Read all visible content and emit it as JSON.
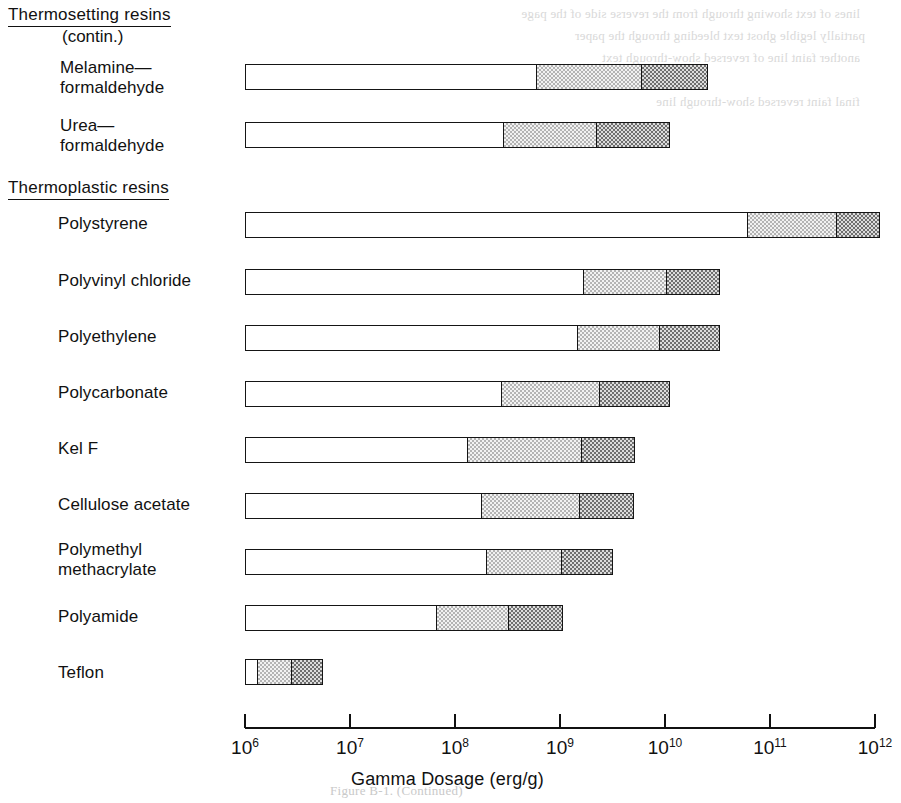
{
  "figure": {
    "caption": "Figure B-1.  (Continued)",
    "bleed_lines": [
      "lines of text showing through from the reverse side of the page",
      "partially legible ghost text bleeding through the paper",
      "another faint line of reversed show-through text",
      "a short faint reversed fragment",
      "final faint reversed show-through line"
    ]
  },
  "groups": [
    {
      "heading": "Thermosetting resins",
      "subheading": "(contin.)"
    },
    {
      "heading": "Thermoplastic resins",
      "subheading": ""
    }
  ],
  "axis": {
    "title": "Gamma Dosage (erg/g)",
    "scale": "log10",
    "min_exponent": 6,
    "max_exponent": 12,
    "tick_labels": [
      "10⁶",
      "10⁷",
      "10⁸",
      "10⁹",
      "10¹⁰",
      "10¹¹",
      "10¹²"
    ],
    "tick_mantissas": [
      "10",
      "10",
      "10",
      "10",
      "10",
      "10",
      "10"
    ],
    "tick_exponents": [
      "6",
      "7",
      "8",
      "9",
      "10",
      "11",
      "12"
    ]
  },
  "legend": {
    "segment_names": [
      "incipient-to-mild damage",
      "moderate damage",
      "severe damage"
    ],
    "segment_fills": [
      "white",
      "light-checker",
      "dark-checker"
    ]
  },
  "chart_data": {
    "type": "bar",
    "subtitle": "",
    "xlabel": "Gamma Dosage (erg/g)",
    "ylabel": "",
    "xscale": "log",
    "xlim": [
      1000000,
      1000000000000
    ],
    "grid": false,
    "orientation": "horizontal",
    "stacked": true,
    "legend_position": "none",
    "series": [
      {
        "name": "incipient-to-mild damage (white)",
        "values": [
          720000000.0,
          280000000.0,
          59000000000.0,
          1600000000.0,
          1400000000.0,
          270000000.0,
          130000000.0,
          170000000.0,
          190000000.0,
          65000000.0,
          1300000.0
        ]
      },
      {
        "name": "moderate damage (light checker)",
        "values": [
          5800000000.0,
          2100000000.0,
          420000000000.0,
          10000000000.0,
          8500000000.0,
          2300000000.0,
          1500000000.0,
          1500000000.0,
          1000000000.0,
          320000000.0,
          2700000.0
        ]
      },
      {
        "name": "severe damage (dark checker)",
        "values": [
          26000000000.0,
          11000000000.0,
          1100000000000.0,
          33000000000.0,
          33000000000.0,
          11000000000.0,
          5100000000.0,
          5000000000.0,
          3200000000.0,
          1100000000.0,
          5500000.0
        ]
      }
    ],
    "categories": [
      "Melamine—formaldehyde",
      "Urea—formaldehyde",
      "Polystyrene",
      "Polyvinyl chloride",
      "Polyethylene",
      "Polycarbonate",
      "Kel F",
      "Cellulose acetate",
      "Polymethyl methacrylate",
      "Polyamide",
      "Teflon"
    ]
  },
  "rows": [
    {
      "label": "Melamine—\n  formaldehyde",
      "group": 0,
      "label_left": 60,
      "label_top": 58,
      "bar_top": 64,
      "start_exp": 6.0,
      "mid_exp": 8.76,
      "dark_exp": 9.76,
      "end_exp": 10.41
    },
    {
      "label": "Urea—\n  formaldehyde",
      "group": 0,
      "label_left": 60,
      "label_top": 116,
      "bar_top": 122,
      "start_exp": 6.0,
      "mid_exp": 8.45,
      "dark_exp": 9.33,
      "end_exp": 10.05
    },
    {
      "label": "Polystyrene",
      "group": 1,
      "label_left": 58,
      "label_top": 214,
      "bar_top": 212,
      "start_exp": 6.0,
      "mid_exp": 10.77,
      "dark_exp": 11.62,
      "end_exp": 12.05
    },
    {
      "label": "Polyvinyl chloride",
      "group": 1,
      "label_left": 58,
      "label_top": 271,
      "bar_top": 269,
      "start_exp": 6.0,
      "mid_exp": 9.21,
      "dark_exp": 10.0,
      "end_exp": 10.52
    },
    {
      "label": "Polyethylene",
      "group": 1,
      "label_left": 58,
      "label_top": 327,
      "bar_top": 325,
      "start_exp": 6.0,
      "mid_exp": 9.15,
      "dark_exp": 9.93,
      "end_exp": 10.52
    },
    {
      "label": "Polycarbonate",
      "group": 1,
      "label_left": 58,
      "label_top": 383,
      "bar_top": 381,
      "start_exp": 6.0,
      "mid_exp": 8.43,
      "dark_exp": 9.36,
      "end_exp": 10.05
    },
    {
      "label": "Kel  F",
      "group": 1,
      "label_left": 58,
      "label_top": 439,
      "bar_top": 437,
      "start_exp": 6.0,
      "mid_exp": 8.1,
      "dark_exp": 9.19,
      "end_exp": 9.71
    },
    {
      "label": "Cellulose acetate",
      "group": 1,
      "label_left": 58,
      "label_top": 495,
      "bar_top": 493,
      "start_exp": 6.0,
      "mid_exp": 8.24,
      "dark_exp": 9.17,
      "end_exp": 9.7
    },
    {
      "label": "Polymethyl\n  methacrylate",
      "group": 1,
      "label_left": 58,
      "label_top": 540,
      "bar_top": 549,
      "start_exp": 6.0,
      "mid_exp": 8.29,
      "dark_exp": 9.0,
      "end_exp": 9.5
    },
    {
      "label": "Polyamide",
      "group": 1,
      "label_left": 58,
      "label_top": 607,
      "bar_top": 605,
      "start_exp": 6.0,
      "mid_exp": 7.81,
      "dark_exp": 8.5,
      "end_exp": 9.03
    },
    {
      "label": "Teflon",
      "group": 1,
      "label_left": 58,
      "label_top": 663,
      "bar_top": 659,
      "start_exp": 6.0,
      "mid_exp": 6.1,
      "dark_exp": 6.43,
      "end_exp": 6.74
    }
  ],
  "layout": {
    "axis_x0": 245,
    "axis_x1": 875,
    "axis_y": 727,
    "px_per_decade": 105
  }
}
